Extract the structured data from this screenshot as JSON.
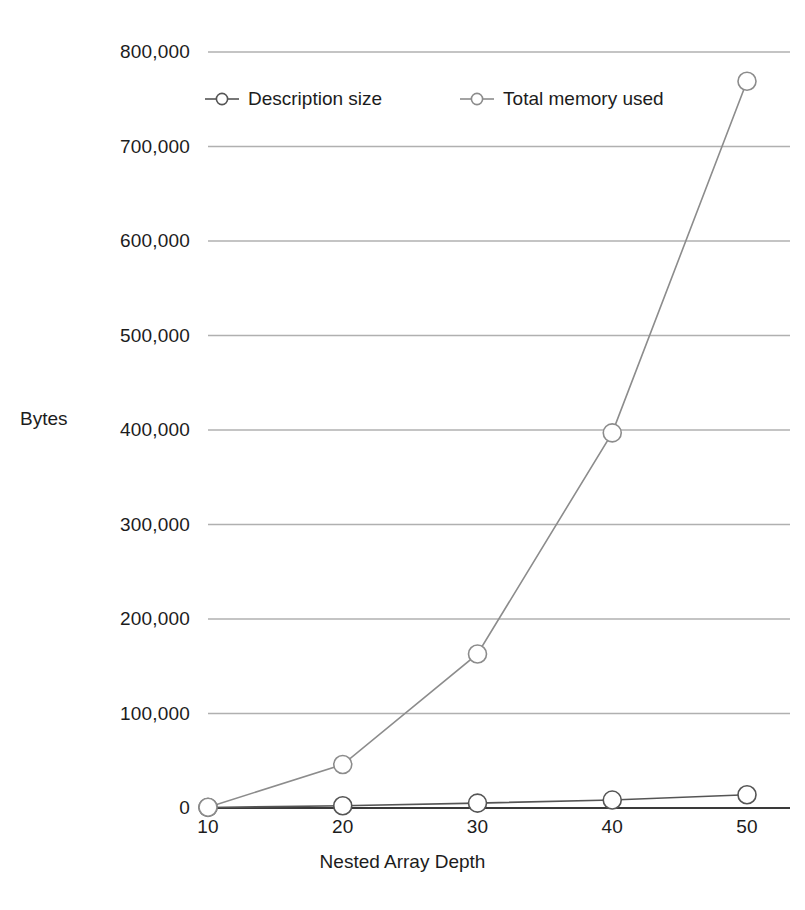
{
  "chart_data": {
    "type": "line",
    "title": "",
    "xlabel": "Nested Array Depth",
    "ylabel": "Bytes",
    "x": [
      10,
      20,
      30,
      40,
      50
    ],
    "xticklabels": [
      "10",
      "20",
      "30",
      "40",
      "50"
    ],
    "yticklabels": [
      "0",
      "100,000",
      "200,000",
      "300,000",
      "400,000",
      "500,000",
      "600,000",
      "700,000",
      "800,000"
    ],
    "ytickvalues": [
      0,
      100000,
      200000,
      300000,
      400000,
      500000,
      600000,
      700000,
      800000
    ],
    "xlim": [
      10,
      50
    ],
    "ylim": [
      0,
      800000
    ],
    "grid": true,
    "legend_position": "top-left-inside",
    "series": [
      {
        "name": "Description size",
        "values": [
          600,
          2400,
          5200,
          8400,
          14000
        ],
        "color": "#555555",
        "marker": "open-circle"
      },
      {
        "name": "Total memory used",
        "values": [
          800,
          46000,
          163000,
          397000,
          769000
        ],
        "color": "#8c8c8c",
        "marker": "open-circle"
      }
    ]
  },
  "legend": {
    "entries": [
      {
        "label": "Description size",
        "marker_name": "legend-marker-description-size"
      },
      {
        "label": "Total memory used",
        "marker_name": "legend-marker-total-memory-used"
      }
    ]
  },
  "axes": {
    "y_title": "Bytes",
    "x_title": "Nested Array Depth",
    "y_ticks": [
      "800,000",
      "700,000",
      "600,000",
      "500,000",
      "400,000",
      "300,000",
      "200,000",
      "100,000",
      "0"
    ],
    "x_ticks": [
      "10",
      "20",
      "30",
      "40",
      "50"
    ]
  },
  "colors": {
    "grid": "#b0b0b0",
    "axis": "#3a3a3a",
    "series_description": "#555555",
    "series_total_memory": "#8c8c8c",
    "text": "#1c1c1c",
    "background": "#ffffff"
  }
}
